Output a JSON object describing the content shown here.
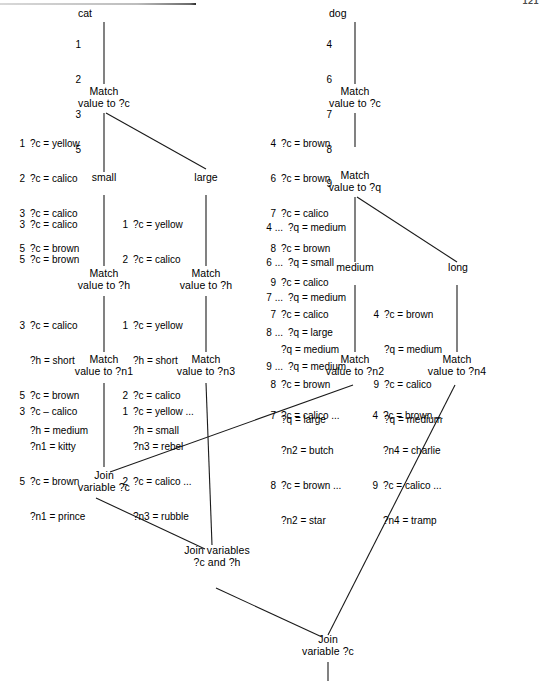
{
  "page": {
    "folio": "121",
    "width": 543,
    "height": 681,
    "ink": "#1a1a1a",
    "paper": "#ffffff"
  },
  "nodes": {
    "cat_root": {
      "label": "cat",
      "tokens": [
        {
          "idx": "1",
          "lines": [
            ""
          ]
        },
        {
          "idx": "2",
          "lines": [
            ""
          ]
        },
        {
          "idx": "3",
          "lines": [
            ""
          ]
        },
        {
          "idx": "5",
          "lines": [
            ""
          ]
        }
      ]
    },
    "dog_root": {
      "label": "dog",
      "tokens": [
        {
          "idx": "4",
          "lines": [
            ""
          ]
        },
        {
          "idx": "6",
          "lines": [
            ""
          ]
        },
        {
          "idx": "7",
          "lines": [
            ""
          ]
        },
        {
          "idx": "8",
          "lines": [
            ""
          ]
        },
        {
          "idx": "9",
          "lines": [
            ""
          ]
        }
      ]
    },
    "cat_match_c": {
      "title": "Match\nvalue to ?c",
      "tokens": [
        {
          "idx": "1",
          "lines": [
            "?c = yellow"
          ]
        },
        {
          "idx": "2",
          "lines": [
            "?c = calico"
          ]
        },
        {
          "idx": "3",
          "lines": [
            "?c = calico"
          ]
        },
        {
          "idx": "5",
          "lines": [
            "?c = brown"
          ]
        }
      ]
    },
    "dog_match_c": {
      "title": "Match\nvalue to ?c",
      "tokens": [
        {
          "idx": "4",
          "lines": [
            "?c = brown"
          ]
        },
        {
          "idx": "6",
          "lines": [
            "?c = brown"
          ]
        },
        {
          "idx": "7",
          "lines": [
            "?c = calico"
          ]
        },
        {
          "idx": "8",
          "lines": [
            "?c = brown"
          ]
        },
        {
          "idx": "9",
          "lines": [
            "?c = calico"
          ]
        }
      ]
    },
    "branch_small": {
      "label": "small"
    },
    "branch_large": {
      "label": "large"
    },
    "branch_medium": {
      "label": "medium"
    },
    "branch_long": {
      "label": "long"
    },
    "small_tokens": {
      "tokens": [
        {
          "idx": "3",
          "lines": [
            "?c = calico"
          ]
        },
        {
          "idx": "5",
          "lines": [
            "?c = brown"
          ]
        }
      ]
    },
    "large_tokens": {
      "tokens": [
        {
          "idx": "1",
          "lines": [
            "?c = yellow"
          ]
        },
        {
          "idx": "2",
          "lines": [
            "?c = calico"
          ]
        }
      ]
    },
    "dog_match_q": {
      "title": "Match\nvalue to ?q",
      "tokens": [
        {
          "idx": "4 ...",
          "lines": [
            "?q = medium"
          ]
        },
        {
          "idx": "6 ...",
          "lines": [
            "?q = small"
          ]
        },
        {
          "idx": "7 ...",
          "lines": [
            "?q = medium"
          ]
        },
        {
          "idx": "8 ...",
          "lines": [
            "?q = large"
          ]
        },
        {
          "idx": "9 ...",
          "lines": [
            "?q = medium"
          ]
        }
      ]
    },
    "medium_tokens": {
      "tokens": [
        {
          "idx": "7",
          "lines": [
            "?c = calico",
            "?q = medium"
          ]
        },
        {
          "idx": "8",
          "lines": [
            "?c = brown",
            "?q = large"
          ]
        }
      ]
    },
    "long_tokens": {
      "tokens": [
        {
          "idx": "4",
          "lines": [
            "?c = brown",
            "?q = medium"
          ]
        },
        {
          "idx": "9",
          "lines": [
            "?c = calico",
            "?q = medium"
          ]
        }
      ]
    },
    "small_match_h": {
      "title": "Match\nvalue to ?h",
      "tokens": [
        {
          "idx": "3",
          "lines": [
            "?c = calico",
            "?h = short"
          ]
        },
        {
          "idx": "5",
          "lines": [
            "?c = brown",
            "?h = medium"
          ]
        }
      ]
    },
    "large_match_h": {
      "title": "Match\nvalue to ?h",
      "tokens": [
        {
          "idx": "1",
          "lines": [
            "?c = yellow",
            "?h = short"
          ]
        },
        {
          "idx": "2",
          "lines": [
            "?c = calico",
            "?h = small"
          ]
        }
      ]
    },
    "match_n1": {
      "title": "Match\nvalue to ?n1",
      "tokens": [
        {
          "idx": "3",
          "lines": [
            "?c – calico",
            "?n1 = kitty"
          ]
        },
        {
          "idx": "5",
          "lines": [
            "?c = brown",
            "?n1 = prince"
          ]
        }
      ]
    },
    "match_n3": {
      "title": "Match\nvalue to ?n3",
      "tokens": [
        {
          "idx": "1",
          "lines": [
            "?c = yellow ...",
            "?n3 = rebel"
          ]
        },
        {
          "idx": "2",
          "lines": [
            "?c = calico ...",
            "?n3 = rubble"
          ]
        }
      ]
    },
    "match_n2": {
      "title": "Match\nvalue to ?n2",
      "tokens": [
        {
          "idx": "7",
          "lines": [
            "?c = calico ...",
            "?n2 = butch"
          ]
        },
        {
          "idx": "8",
          "lines": [
            "?c = brown ...",
            "?n2 = star"
          ]
        }
      ]
    },
    "match_n4": {
      "title": "Match\nvalue to ?n4",
      "tokens": [
        {
          "idx": "4",
          "lines": [
            "?c = brown ...",
            "?n4 = charlie"
          ]
        },
        {
          "idx": "9",
          "lines": [
            "?c = calico ...",
            "?n4 = tramp"
          ]
        }
      ]
    },
    "join_c_left": {
      "title": "Join\nvariable ?c"
    },
    "join_c_h": {
      "title": "Join variables\n?c and ?h"
    },
    "join_c_bottom": {
      "title": "Join\nvariable ?c"
    }
  }
}
